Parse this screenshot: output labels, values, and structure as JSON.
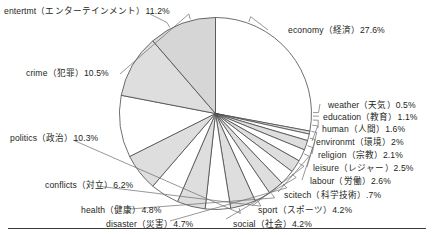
{
  "chart_data": {
    "type": "pie",
    "title": "",
    "subtitle": "",
    "xlabel": "",
    "ylabel": "",
    "legend_position": "callout-labels",
    "grid": false,
    "start_angle_deg": 0,
    "direction": "clockwise",
    "unit": "%",
    "categories": [
      "economy（経済）",
      "weather（天気）",
      "education（教育）",
      "human（人間）",
      "environmt（環境）",
      "religion（宗教）",
      "leisure（レジャー）",
      "labour（労働）",
      "scitech（科学技術）",
      "sport（スポーツ）",
      "social（社会）",
      "disaster（災害）",
      "health（健康）",
      "conflicts（対立）",
      "politics（政治）",
      "crime（犯罪）",
      "entertmt（エンターテインメント）"
    ],
    "values": [
      27.6,
      0.5,
      1.1,
      1.6,
      2.0,
      2.1,
      2.5,
      2.6,
      2.7,
      4.2,
      4.2,
      4.7,
      4.8,
      6.2,
      10.3,
      10.5,
      11.2
    ],
    "value_labels": [
      "27.6%",
      "0.5%",
      "1.1%",
      "1.6%",
      "2%",
      "2.1%",
      "2.5%",
      "2.6%",
      ".7%",
      "4.2%",
      "4.2%",
      "4.7%",
      "4.8%",
      "6.2%",
      "10.3%",
      "10.5%",
      "11.2%"
    ],
    "slice_fills": [
      "#ffffff",
      "#dedede",
      "#ffffff",
      "#dedede",
      "#ffffff",
      "#dedede",
      "#ffffff",
      "#dedede",
      "#ffffff",
      "#dedede",
      "#ffffff",
      "#dedede",
      "#ffffff",
      "#dedede",
      "#ffffff",
      "#dedede",
      "#d6d6d6"
    ],
    "stroke_color": "#4a4a4a",
    "background": "#ffffff"
  },
  "labels": {
    "entertmt": {
      "text": "entertmt（エンターテインメント）11.2%"
    },
    "economy": {
      "text": "economy（経済）27.6%"
    },
    "crime": {
      "text": "crime（犯罪）10.5%"
    },
    "politics": {
      "text": "politics（政治）10.3%"
    },
    "conflicts": {
      "text": "conflicts（対立）6.2%"
    },
    "health": {
      "text": "health（健康）4.8%"
    },
    "disaster": {
      "text": "disaster（災害）4.7%"
    },
    "social": {
      "text": "social（社会）4.2%"
    },
    "sport": {
      "text": "sport（スポーツ）4.2%"
    },
    "scitech": {
      "text": "scitech（科学技術）.7%"
    },
    "labour": {
      "text": "labour（労働）2.6%"
    },
    "leisure": {
      "text": "leisure（レジャー）2.5%"
    },
    "religion": {
      "text": "religion（宗教）2.1%"
    },
    "environmt": {
      "text": "environmt（環境）2%"
    },
    "human": {
      "text": "human（人間）1.6%"
    },
    "education": {
      "text": "education（教育）1.1%"
    },
    "weather": {
      "text": "weather（天気）0.5%"
    }
  }
}
